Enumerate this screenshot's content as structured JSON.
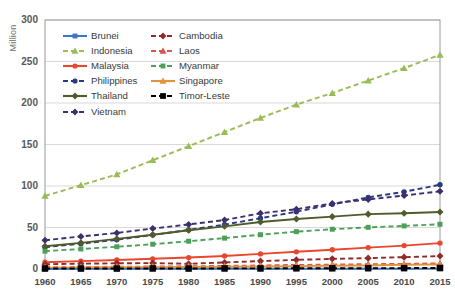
{
  "chart_data": {
    "type": "line",
    "title": "",
    "xlabel": "",
    "ylabel": "Million",
    "xlim": [
      1960,
      2015
    ],
    "ylim": [
      0,
      300
    ],
    "yticks": [
      0,
      50,
      100,
      150,
      200,
      250,
      300
    ],
    "grid": true,
    "legend_position": "upper-left-inside",
    "x": [
      1960,
      1965,
      1970,
      1975,
      1980,
      1985,
      1990,
      1995,
      2000,
      2005,
      2010,
      2015
    ],
    "categories": [
      "1960",
      "1965",
      "1970",
      "1975",
      "1980",
      "1985",
      "1990",
      "1995",
      "2000",
      "2005",
      "2010",
      "2015"
    ],
    "series": [
      {
        "name": "Brunei",
        "color": "#3d77bf",
        "marker": "square",
        "dash": "solid",
        "values": [
          0.08,
          0.1,
          0.13,
          0.16,
          0.19,
          0.22,
          0.26,
          0.29,
          0.33,
          0.36,
          0.39,
          0.42
        ]
      },
      {
        "name": "Cambodia",
        "color": "#8f2b2b",
        "marker": "diamond",
        "dash": "dashed",
        "values": [
          5.7,
          6.4,
          6.9,
          7.1,
          6.3,
          7.9,
          9.5,
          11.0,
          12.2,
          13.1,
          14.3,
          15.6
        ]
      },
      {
        "name": "Indonesia",
        "color": "#9bbb59",
        "marker": "triangle",
        "dash": "dashed",
        "values": [
          88,
          101,
          114,
          131,
          148,
          165,
          182,
          198,
          212,
          227,
          242,
          258
        ]
      },
      {
        "name": "Laos",
        "color": "#d9534f",
        "marker": "triangle",
        "dash": "dashed",
        "values": [
          2.1,
          2.4,
          2.7,
          3.0,
          3.3,
          3.7,
          4.3,
          4.9,
          5.3,
          5.8,
          6.2,
          6.8
        ]
      },
      {
        "name": "Malaysia",
        "color": "#e8472d",
        "marker": "circle",
        "dash": "solid",
        "values": [
          8.2,
          9.5,
          10.9,
          12.3,
          13.8,
          15.7,
          18.2,
          20.7,
          23.2,
          25.8,
          28.2,
          31.2
        ]
      },
      {
        "name": "Myanmar",
        "color": "#4da05a",
        "marker": "square",
        "dash": "dashed",
        "values": [
          21.5,
          24.1,
          26.8,
          29.9,
          33.5,
          37.2,
          41.3,
          45.0,
          47.9,
          50.2,
          51.9,
          53.9
        ]
      },
      {
        "name": "Philippines",
        "color": "#2b3a80",
        "marker": "circle",
        "dash": "dashed",
        "values": [
          26.3,
          30.4,
          35.2,
          41.0,
          47.1,
          53.5,
          61.2,
          69.0,
          77.9,
          86.3,
          93.0,
          101.5
        ]
      },
      {
        "name": "Singapore",
        "color": "#e2943b",
        "marker": "triangle",
        "dash": "solid",
        "values": [
          1.6,
          1.9,
          2.1,
          2.3,
          2.4,
          2.7,
          3.0,
          3.5,
          4.0,
          4.3,
          5.1,
          5.5
        ]
      },
      {
        "name": "Thailand",
        "color": "#4f5b2a",
        "marker": "diamond",
        "dash": "solid",
        "values": [
          27.4,
          31.5,
          36.3,
          41.3,
          46.7,
          51.4,
          56.6,
          60.2,
          63.1,
          66.1,
          67.2,
          68.7
        ]
      },
      {
        "name": "Timor-Leste",
        "color": "#000000",
        "marker": "square",
        "dash": "dashed",
        "values": [
          0.6,
          0.6,
          0.6,
          0.7,
          0.6,
          0.7,
          0.7,
          0.9,
          0.9,
          1.0,
          1.1,
          1.2
        ]
      },
      {
        "name": "Vietnam",
        "color": "#3d2f6e",
        "marker": "diamond",
        "dash": "dashed",
        "values": [
          34.7,
          39.2,
          43.4,
          48.7,
          53.7,
          59.0,
          67.1,
          72.0,
          79.0,
          83.8,
          88.5,
          93.6
        ]
      }
    ]
  },
  "axis": {
    "ylabel": "Million",
    "yticks": [
      "0",
      "50",
      "100",
      "150",
      "200",
      "250",
      "300"
    ],
    "xticks": [
      "1960",
      "1965",
      "1970",
      "1975",
      "1980",
      "1985",
      "1990",
      "1995",
      "2000",
      "2005",
      "2010",
      "2015"
    ]
  },
  "legend": {
    "entries": [
      {
        "label": "Brunei"
      },
      {
        "label": "Cambodia"
      },
      {
        "label": "Indonesia"
      },
      {
        "label": "Laos"
      },
      {
        "label": "Malaysia"
      },
      {
        "label": "Myanmar"
      },
      {
        "label": "Philippines"
      },
      {
        "label": "Singapore"
      },
      {
        "label": "Thailand"
      },
      {
        "label": "Timor-Leste"
      },
      {
        "label": "Vietnam"
      }
    ]
  },
  "colors": {
    "grid": "#d9d9d9",
    "border": "#9a9a9a",
    "background": "#ffffff",
    "tick_text": "#4a4a4a"
  }
}
